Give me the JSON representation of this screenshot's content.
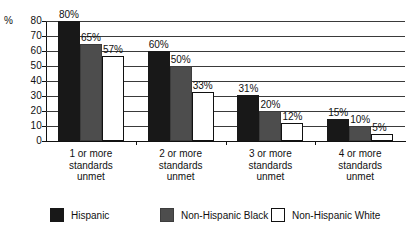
{
  "chart_data": {
    "type": "bar",
    "title": "",
    "subtitle": "",
    "xlabel": "",
    "ylabel": "%",
    "ylim": [
      0,
      80
    ],
    "yticks": [
      0,
      10,
      20,
      30,
      40,
      50,
      60,
      70,
      80
    ],
    "ytick_labels": [
      "0",
      "10",
      "20",
      "30",
      "40",
      "50",
      "60",
      "70",
      "80"
    ],
    "grid": true,
    "grid_axis": "y",
    "legend_position": "bottom",
    "categories": [
      "1 or more standards unmet",
      "2 or more standards unmet",
      "3 or more standards unmet",
      "4 or more standards unmet"
    ],
    "category_lines": [
      [
        "1 or more",
        "standards",
        "unmet"
      ],
      [
        "2 or more",
        "standards",
        "unmet"
      ],
      [
        "3 or more",
        "standards",
        "unmet"
      ],
      [
        "4 or more",
        "standards",
        "unmet"
      ]
    ],
    "series": [
      {
        "name": "Hispanic",
        "color": "#181818",
        "values": [
          80,
          60,
          31,
          15
        ],
        "labels": [
          "80%",
          "60%",
          "31%",
          "15%"
        ]
      },
      {
        "name": "Non-Hispanic Black",
        "color": "#4d4d4d",
        "values": [
          65,
          50,
          20,
          10
        ],
        "labels": [
          "65%",
          "50%",
          "20%",
          "10%"
        ]
      },
      {
        "name": "Non-Hispanic White",
        "color": "#ffffff",
        "values": [
          57,
          33,
          12,
          5
        ],
        "labels": [
          "57%",
          "33%",
          "12%",
          "5%"
        ]
      }
    ]
  },
  "axis": {
    "percent_sign": "%"
  },
  "legend": {
    "items": [
      {
        "label": "Hispanic",
        "color": "#181818"
      },
      {
        "label": "Non-Hispanic Black",
        "color": "#4d4d4d"
      },
      {
        "label": "Non-Hispanic White",
        "color": "#ffffff"
      }
    ]
  }
}
